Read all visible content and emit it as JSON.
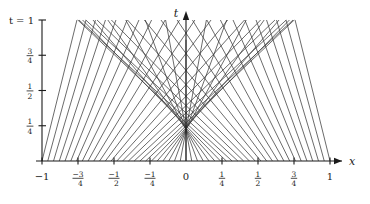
{
  "figure": {
    "kind": "characteristics-fan",
    "axis_t_label": "t",
    "axis_x_label": "x",
    "t_top_label": "t = 1",
    "line_color": "#3a3a3a",
    "axis_color": "#1a1a1a",
    "background": "#ffffff"
  },
  "axes": {
    "x_ticks": [
      {
        "value": -1,
        "label_main": "−1",
        "label_num": "",
        "label_den": ""
      },
      {
        "value": -0.75,
        "label_main": "",
        "label_num": "−3",
        "label_den": "4"
      },
      {
        "value": -0.5,
        "label_main": "",
        "label_num": "−1",
        "label_den": "2"
      },
      {
        "value": -0.25,
        "label_main": "",
        "label_num": "−1",
        "label_den": "4"
      },
      {
        "value": 0,
        "label_main": "0",
        "label_num": "",
        "label_den": ""
      },
      {
        "value": 0.25,
        "label_main": "",
        "label_num": "1",
        "label_den": "4"
      },
      {
        "value": 0.5,
        "label_main": "",
        "label_num": "1",
        "label_den": "2"
      },
      {
        "value": 0.75,
        "label_main": "",
        "label_num": "3",
        "label_den": "4"
      },
      {
        "value": 1,
        "label_main": "1",
        "label_num": "",
        "label_den": ""
      }
    ],
    "t_ticks": [
      {
        "value": 0.25,
        "label_main": "",
        "label_num": "1",
        "label_den": "4"
      },
      {
        "value": 0.5,
        "label_main": "",
        "label_num": "1",
        "label_den": "2"
      },
      {
        "value": 0.75,
        "label_main": "",
        "label_num": "3",
        "label_den": "4"
      },
      {
        "value": 1,
        "label_main": "t = 1",
        "label_num": "",
        "label_den": ""
      }
    ],
    "xlim": [
      -1.18,
      1.18
    ],
    "tlim": [
      0,
      1.06
    ],
    "grid": false
  },
  "chart_data": {
    "type": "line",
    "xlabel": "x",
    "ylabel": "t",
    "xlim": [
      -1.18,
      1.18
    ],
    "ylim": [
      0,
      1.06
    ],
    "grid": false,
    "legend": "none",
    "focus_node": {
      "x": 0,
      "t": 0.22
    },
    "x_start_values": [
      -1.0,
      -0.96,
      -0.92,
      -0.88,
      -0.84,
      -0.8,
      -0.76,
      -0.72,
      -0.68,
      -0.64,
      -0.6,
      -0.56,
      -0.52,
      -0.48,
      -0.44,
      -0.4,
      -0.36,
      -0.32,
      -0.28,
      -0.24,
      -0.2,
      -0.16,
      -0.12,
      -0.08,
      -0.04,
      0.0,
      0.04,
      0.08,
      0.12,
      0.16,
      0.2,
      0.24,
      0.28,
      0.32,
      0.36,
      0.4,
      0.44,
      0.48,
      0.52,
      0.56,
      0.6,
      0.64,
      0.68,
      0.72,
      0.76,
      0.8,
      0.84,
      0.88,
      0.92,
      0.96,
      1.0
    ],
    "rule": "Each characteristic leaves (x0, 0) as a straight ray toward the t-axis; the ray from x0 meets x = 0 at t = 0.22 * (1 - |x0|) + 0.86 * |x0| when |x0| is large, so outer rays stay steeper and cross the top of the frame.",
    "series": [
      {
        "name": "left-running characteristics",
        "count": 25,
        "direction": "up-right"
      },
      {
        "name": "right-running characteristics",
        "count": 25,
        "direction": "up-left"
      },
      {
        "name": "central vertical characteristic",
        "count": 1,
        "direction": "vertical"
      }
    ]
  }
}
